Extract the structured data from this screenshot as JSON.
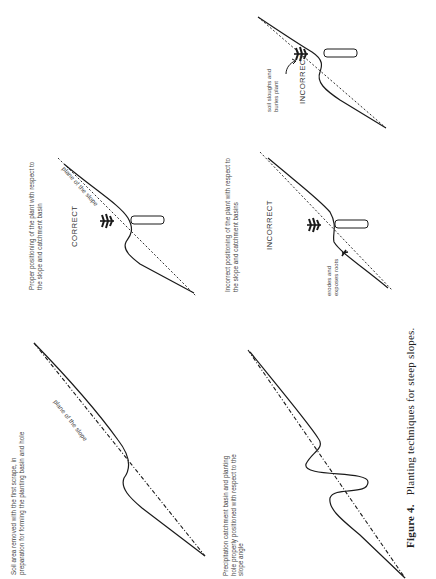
{
  "figure": {
    "number": "Figure 4.",
    "title": "Planting techniques for steep slopes."
  },
  "panels": [
    {
      "id": "scrape",
      "description_lines": [
        "Soil area removed with the first scrape, in",
        "preparation for forming the planting basin and hole"
      ],
      "slope_label": "plane of the slope"
    },
    {
      "id": "basin",
      "description_lines": [
        "Precipitation catchment basin and planting",
        "hole properly positioned with respect to the",
        "slope angle"
      ]
    },
    {
      "id": "correct",
      "description_lines": [
        "Proper positioning of the plant with respect to",
        "the slope and catchment basin"
      ],
      "verdict": "CORRECT",
      "slope_label": "plane of the slope"
    },
    {
      "id": "incorrect-low",
      "description_lines": [
        "Incorrect positioning of the plant with respect to",
        "the slope and catchment basins"
      ],
      "verdict": "INCORRECT",
      "note_lines": [
        "erodes and",
        "exposes roots"
      ]
    },
    {
      "id": "incorrect-high",
      "verdict": "INCORRECT",
      "note_lines": [
        "soil sloughs and",
        "buries plant"
      ]
    }
  ],
  "colors": {
    "line": "#1a1a1a",
    "text": "#333333",
    "background": "#ffffff"
  }
}
